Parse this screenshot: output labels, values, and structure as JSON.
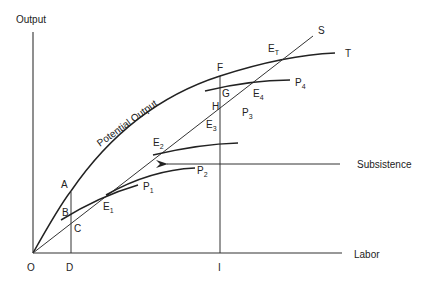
{
  "diagram": {
    "type": "economic-diagram",
    "axes": {
      "y_label": "Output",
      "x_label": "Labor",
      "origin_label": "O",
      "x_marks": [
        "D",
        "I"
      ]
    },
    "curves": {
      "potential_output": "Potential Output",
      "total_curve_label": "T",
      "subsistence_line_label": "S",
      "production_curves": [
        "P",
        "P",
        "P",
        "P"
      ],
      "production_subs": [
        "1",
        "2",
        "3",
        "4"
      ]
    },
    "points": {
      "A": "A",
      "B": "B",
      "C": "C",
      "F": "F",
      "G": "G",
      "H": "H",
      "E": "E",
      "e_subs": [
        "1",
        "2",
        "3",
        "4",
        "T"
      ]
    },
    "annotation": {
      "subsistence_label": "Subsistence"
    },
    "colors": {
      "line": "#222222",
      "background": "#ffffff"
    }
  }
}
